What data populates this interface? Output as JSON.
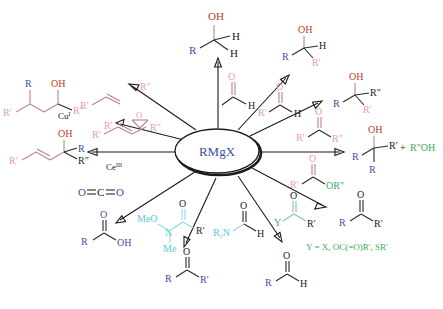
{
  "diagram": {
    "type": "radial-reaction-scheme",
    "center": {
      "label": "RMgX",
      "color": "#3a4fa8",
      "shape": "oval"
    },
    "colors": {
      "product_blue": "#3a4fa8",
      "hydroxyl_red": "#c0392b",
      "reagent_pink": "#e8a0a8",
      "reagent_cyan": "#5fc6e0",
      "leaving_green": "#3aa95e",
      "arrow_black": "#1a1a1a"
    },
    "legend": {
      "y_definition": "Y = X, OC(=O)R', SR'"
    },
    "catalysts": [
      {
        "id": "cu",
        "label": "Cu",
        "superscript": "I"
      },
      {
        "id": "ce",
        "label": "Ce",
        "superscript": "III"
      }
    ],
    "branches": [
      {
        "id": "formaldehyde",
        "direction": "top",
        "reagent": {
          "formula": "H-CHO",
          "atoms": [
            "O",
            "H"
          ],
          "color": "#e8a0a8"
        },
        "product": {
          "name": "primary-alcohol",
          "atoms": [
            "OH",
            "R",
            "H",
            "H"
          ]
        }
      },
      {
        "id": "aldehyde",
        "direction": "top-right",
        "reagent": {
          "formula": "R'CHO",
          "atoms": [
            "O",
            "R'",
            "H"
          ],
          "color": "#e8a0a8"
        },
        "product": {
          "name": "secondary-alcohol",
          "atoms": [
            "OH",
            "R",
            "H",
            "R'"
          ]
        }
      },
      {
        "id": "ketone",
        "direction": "right-upper",
        "reagent": {
          "formula": "R'C(=O)R\"",
          "atoms": [
            "O",
            "R'",
            "R\""
          ],
          "color": "#e8a0a8"
        },
        "product": {
          "name": "tertiary-alcohol",
          "atoms": [
            "OH",
            "R",
            "R\"",
            "R'"
          ]
        }
      },
      {
        "id": "ester",
        "direction": "right",
        "reagent": {
          "formula": "R'C(=O)OR\"",
          "atoms": [
            "O",
            "R'",
            "OR\""
          ],
          "color": "#e8a0a8",
          "leaving_group": "OR\""
        },
        "product": {
          "name": "tertiary-alcohol-double-addition",
          "atoms": [
            "OH",
            "R",
            "R'",
            "R"
          ],
          "coproduct": "R\"OH"
        }
      },
      {
        "id": "acyl-derivative",
        "direction": "right-lower",
        "reagent": {
          "formula": "YC(=O)R'",
          "atoms": [
            "O",
            "Y",
            "R'"
          ],
          "color": "#3aa95e"
        },
        "product": {
          "name": "ketone",
          "atoms": [
            "O",
            "R",
            "R'"
          ]
        }
      },
      {
        "id": "formamide",
        "direction": "bottom-right",
        "reagent": {
          "formula": "R2N-CHO",
          "atoms": [
            "O",
            "R2N",
            "H"
          ],
          "color": "#5fc6e0"
        },
        "product": {
          "name": "aldehyde",
          "atoms": [
            "O",
            "R",
            "H"
          ]
        }
      },
      {
        "id": "weinreb-amide",
        "direction": "bottom",
        "reagent": {
          "formula": "MeO(Me)N-C(=O)R'",
          "atoms": [
            "O",
            "MeO",
            "N",
            "Me",
            "R'"
          ],
          "color": "#5fc6e0"
        },
        "product": {
          "name": "ketone",
          "atoms": [
            "O",
            "R",
            "R'"
          ]
        }
      },
      {
        "id": "carbon-dioxide",
        "direction": "bottom-left",
        "reagent": {
          "formula": "O=C=O",
          "atoms": [
            "O",
            "C",
            "O"
          ],
          "color": "#3a4fa8"
        },
        "product": {
          "name": "carboxylic-acid",
          "atoms": [
            "O",
            "R",
            "OH"
          ]
        }
      },
      {
        "id": "enone-ce",
        "direction": "left",
        "reagent": {
          "formula": "R'CH=CH-C(=O)R\"",
          "color": "#e8a0a8"
        },
        "catalyst": "Ce",
        "catalyst_superscript": "III",
        "product": {
          "name": "allylic-alcohol-1,2-addition",
          "atoms": [
            "OH",
            "R'",
            "R",
            "R\""
          ]
        }
      },
      {
        "id": "enone-cu",
        "direction": "top-left",
        "reagent": {
          "formula": "R'CH=CH-C(=O)R\"",
          "color": "#e8a0a8"
        },
        "catalyst": "Cu",
        "catalyst_superscript": "I",
        "product": {
          "name": "1,4-conjugate-addition-ketone",
          "atoms": [
            "R",
            "OH",
            "R'",
            "R\""
          ]
        }
      }
    ]
  }
}
